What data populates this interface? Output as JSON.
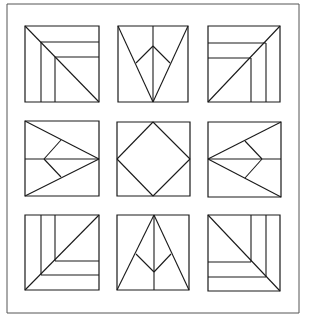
{
  "figure": {
    "width": 309,
    "height": 324,
    "background": "#ffffff",
    "stroke_color": "#1a1a1a",
    "frame_color": "#555555",
    "frame": {
      "x1": 7,
      "y1": 4,
      "x2": 299,
      "y2": 313
    }
  },
  "tiles": [
    {
      "name": "tile-top-left-corner-steps",
      "box": [
        25,
        26,
        99,
        102
      ],
      "lines": [
        [
          25,
          26,
          99,
          102
        ],
        [
          41,
          42,
          41,
          102
        ],
        [
          55,
          57,
          55,
          102
        ],
        [
          41,
          42,
          99,
          42
        ],
        [
          55,
          57,
          99,
          57
        ]
      ]
    },
    {
      "name": "tile-top-center-arrow-down",
      "box": [
        118,
        26,
        188,
        102
      ],
      "lines": [
        [
          118,
          26,
          153,
          102
        ],
        [
          188,
          26,
          153,
          102
        ],
        [
          153,
          26,
          153,
          102
        ],
        [
          153,
          46,
          136,
          63
        ],
        [
          153,
          46,
          170,
          63
        ]
      ]
    },
    {
      "name": "tile-top-right-corner-steps",
      "box": [
        208,
        26,
        280,
        102
      ],
      "lines": [
        [
          208,
          102,
          280,
          26
        ],
        [
          208,
          43,
          266,
          43
        ],
        [
          208,
          58,
          251,
          58
        ],
        [
          266,
          43,
          266,
          102
        ],
        [
          251,
          58,
          251,
          102
        ]
      ]
    },
    {
      "name": "tile-middle-left-arrow-right",
      "box": [
        25,
        121,
        99,
        196
      ],
      "lines": [
        [
          25,
          121,
          99,
          159
        ],
        [
          25,
          196,
          99,
          159
        ],
        [
          25,
          159,
          99,
          159
        ],
        [
          44,
          159,
          61,
          140
        ],
        [
          44,
          159,
          61,
          177
        ]
      ]
    },
    {
      "name": "tile-center-diamond",
      "box": [
        117,
        122,
        190,
        196
      ],
      "lines": [
        [
          153,
          122,
          190,
          159
        ],
        [
          190,
          159,
          153,
          196
        ],
        [
          153,
          196,
          117,
          159
        ],
        [
          117,
          159,
          153,
          122
        ]
      ]
    },
    {
      "name": "tile-middle-right-arrow-left",
      "box": [
        208,
        122,
        281,
        197
      ],
      "lines": [
        [
          281,
          122,
          208,
          159
        ],
        [
          281,
          197,
          208,
          159
        ],
        [
          208,
          159,
          281,
          159
        ],
        [
          262,
          159,
          245,
          141
        ],
        [
          262,
          159,
          245,
          178
        ]
      ]
    },
    {
      "name": "tile-bottom-left-corner-steps",
      "box": [
        25,
        215,
        99,
        290
      ],
      "lines": [
        [
          25,
          290,
          99,
          215
        ],
        [
          41,
          215,
          41,
          275
        ],
        [
          55,
          215,
          55,
          261
        ],
        [
          55,
          261,
          99,
          261
        ],
        [
          41,
          275,
          99,
          275
        ]
      ]
    },
    {
      "name": "tile-bottom-center-arrow-up",
      "box": [
        117,
        215,
        189,
        290
      ],
      "lines": [
        [
          154,
          215,
          117,
          290
        ],
        [
          154,
          215,
          189,
          290
        ],
        [
          154,
          215,
          154,
          290
        ],
        [
          154,
          272,
          136,
          254
        ],
        [
          154,
          272,
          171,
          254
        ]
      ]
    },
    {
      "name": "tile-bottom-right-corner-steps",
      "box": [
        208,
        215,
        280,
        291
      ],
      "lines": [
        [
          208,
          215,
          280,
          291
        ],
        [
          251,
          215,
          251,
          262
        ],
        [
          266,
          215,
          266,
          277
        ],
        [
          208,
          262,
          251,
          262
        ],
        [
          208,
          277,
          266,
          277
        ]
      ]
    }
  ]
}
